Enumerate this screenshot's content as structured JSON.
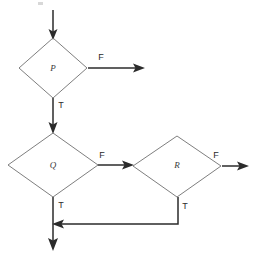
{
  "diagram": {
    "type": "flowchart",
    "title": "",
    "nodes": [
      {
        "id": "P",
        "label": "P",
        "shape": "diamond",
        "cx": 53,
        "cy": 68,
        "rx": 34,
        "ry": 30
      },
      {
        "id": "Q",
        "label": "Q",
        "shape": "diamond",
        "cx": 53,
        "cy": 165,
        "rx": 45,
        "ry": 32
      },
      {
        "id": "R",
        "label": "R",
        "shape": "diamond",
        "cx": 177,
        "cy": 166,
        "rx": 44,
        "ry": 30
      }
    ],
    "branch_labels": [
      {
        "id": "p-false",
        "text": "F",
        "x": 101,
        "y": 58
      },
      {
        "id": "p-true",
        "text": "T",
        "x": 61,
        "y": 106
      },
      {
        "id": "q-false",
        "text": "F",
        "x": 102,
        "y": 156
      },
      {
        "id": "q-true",
        "text": "T",
        "x": 61,
        "y": 206
      },
      {
        "id": "r-false",
        "text": "F",
        "x": 216,
        "y": 156
      },
      {
        "id": "r-true",
        "text": "T",
        "x": 185,
        "y": 207
      }
    ],
    "edges": [
      {
        "id": "entry-to-p",
        "from": "",
        "to": "P",
        "label": "",
        "path": "M 53 10 L 53 36",
        "arrow": "down",
        "arrow_x": 53,
        "arrow_y": 38
      },
      {
        "id": "p-false-out",
        "from": "P",
        "to": "",
        "label": "F",
        "path": "M 88 68 L 140 68",
        "arrow": "right",
        "arrow_x": 143,
        "arrow_y": 68
      },
      {
        "id": "p-true-to-q",
        "from": "P",
        "to": "Q",
        "label": "T",
        "path": "M 53 98 L 53 130",
        "arrow": "down",
        "arrow_x": 53,
        "arrow_y": 133
      },
      {
        "id": "q-false-to-r",
        "from": "Q",
        "to": "R",
        "label": "F",
        "path": "M 98 165 L 128 165",
        "arrow": "right",
        "arrow_x": 131,
        "arrow_y": 165
      },
      {
        "id": "r-false-out",
        "from": "R",
        "to": "",
        "label": "F",
        "path": "M 222 166 L 244 166",
        "arrow": "right",
        "arrow_x": 247,
        "arrow_y": 166
      },
      {
        "id": "r-true-to-merge",
        "from": "R",
        "to": "merge",
        "label": "T",
        "path": "M 178 197 L 178 224 L 58 224",
        "arrow": "left",
        "arrow_x": 54,
        "arrow_y": 224
      },
      {
        "id": "q-true-exit",
        "from": "Q",
        "to": "",
        "label": "T",
        "path": "M 53 197 L 53 246",
        "arrow": "down",
        "arrow_x": 53,
        "arrow_y": 250
      }
    ],
    "colors": {
      "diamond_stroke": "#6f6f6f",
      "line_stroke": "#2b2b2b",
      "label_fill": "#3a3a3a",
      "background": "#ffffff"
    }
  }
}
